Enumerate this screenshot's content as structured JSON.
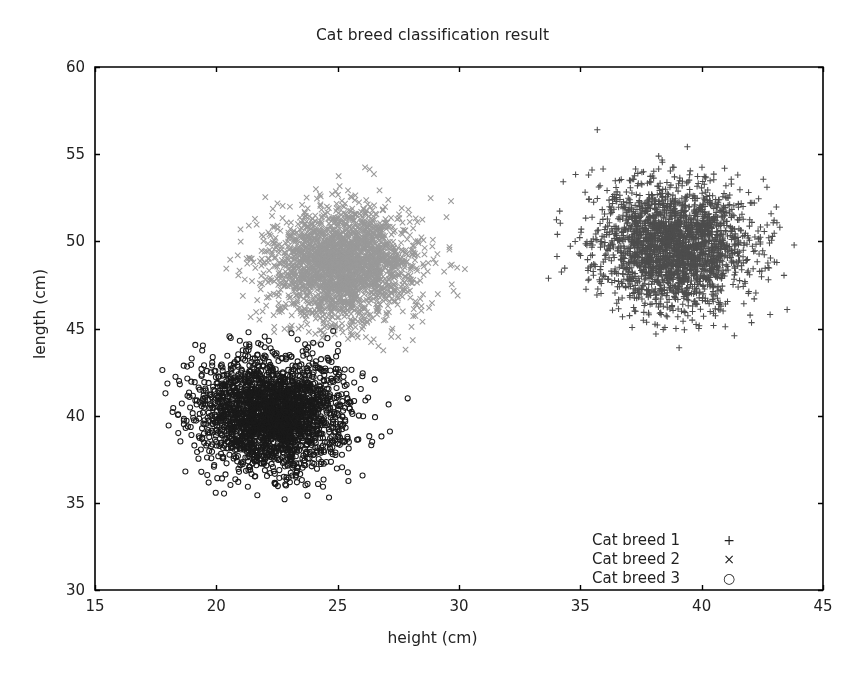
{
  "chart_data": {
    "type": "scatter",
    "title": "Cat breed classification result",
    "xlabel": "height (cm)",
    "ylabel": "length (cm)",
    "xlim": [
      15,
      45
    ],
    "ylim": [
      30,
      60
    ],
    "xticks": [
      15,
      20,
      25,
      30,
      35,
      40,
      45
    ],
    "yticks": [
      30,
      35,
      40,
      45,
      50,
      55,
      60
    ],
    "xtick_labels": [
      "15",
      "20",
      "25",
      "30",
      "35",
      "40",
      "45"
    ],
    "ytick_labels": [
      "30",
      "35",
      "40",
      "45",
      "50",
      "55",
      "60"
    ],
    "grid": false,
    "legend_position": "lower right",
    "background": "#ffffff",
    "frame_color": "#000000",
    "series": [
      {
        "name": "Cat breed 1",
        "marker": "plus",
        "marker_glyph": "+",
        "color": "#4d4d4d",
        "n_points": 2400,
        "center_x": 38.8,
        "center_y": 49.8,
        "std_x": 1.55,
        "std_y": 1.75,
        "x_range": [
          32.6,
          43.9
        ],
        "y_range": [
          43.5,
          57.0
        ]
      },
      {
        "name": "Cat breed 2",
        "marker": "x",
        "marker_glyph": "×",
        "color": "#999999",
        "n_points": 2400,
        "center_x": 25.2,
        "center_y": 48.6,
        "std_x": 1.5,
        "std_y": 1.6,
        "x_range": [
          19.5,
          31.2
        ],
        "y_range": [
          43.5,
          54.4
        ]
      },
      {
        "name": "Cat breed 3",
        "marker": "circle",
        "marker_glyph": "○",
        "color": "#1a1a1a",
        "n_points": 2400,
        "center_x": 22.3,
        "center_y": 40.1,
        "std_x": 1.5,
        "std_y": 1.6,
        "x_range": [
          17.3,
          28.1
        ],
        "y_range": [
          33.8,
          44.9
        ]
      }
    ]
  },
  "legend": {
    "items": [
      {
        "label": "Cat breed 1",
        "glyph": "+"
      },
      {
        "label": "Cat breed 2",
        "glyph": "×"
      },
      {
        "label": "Cat breed 3",
        "glyph": "○"
      }
    ]
  }
}
